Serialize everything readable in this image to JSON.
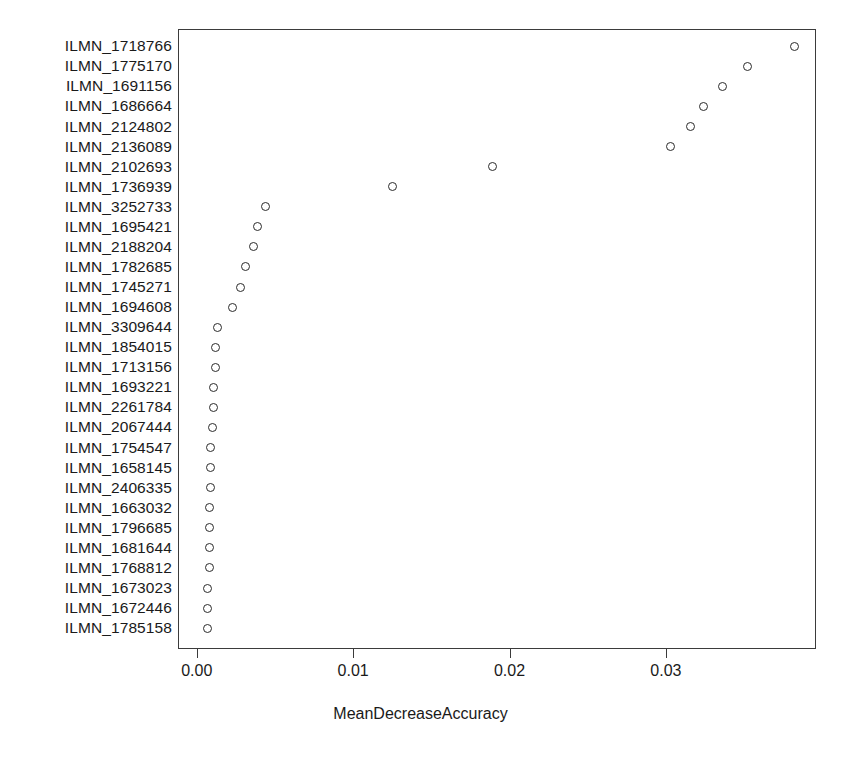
{
  "chart_data": {
    "type": "scatter",
    "title": "",
    "xlabel": "MeanDecreaseAccuracy",
    "ylabel": "",
    "xlim": [
      -0.0012,
      0.0396
    ],
    "xticks": [
      0.0,
      0.01,
      0.02,
      0.03
    ],
    "xtick_labels": [
      "0.00",
      "0.01",
      "0.02",
      "0.03"
    ],
    "grid": false,
    "legend": null,
    "orientation": "horizontal-dotchart",
    "marker": "open-circle",
    "categories": [
      "ILMN_1718766",
      "ILMN_1775170",
      "ILMN_1691156",
      "ILMN_1686664",
      "ILMN_2124802",
      "ILMN_2136089",
      "ILMN_2102693",
      "ILMN_1736939",
      "ILMN_3252733",
      "ILMN_1695421",
      "ILMN_2188204",
      "ILMN_1782685",
      "ILMN_1745271",
      "ILMN_1694608",
      "ILMN_3309644",
      "ILMN_1854015",
      "ILMN_1713156",
      "ILMN_1693221",
      "ILMN_2261784",
      "ILMN_2067444",
      "ILMN_1754547",
      "ILMN_1658145",
      "ILMN_2406335",
      "ILMN_1663032",
      "ILMN_1796685",
      "ILMN_1681644",
      "ILMN_1768812",
      "ILMN_1673023",
      "ILMN_1672446",
      "ILMN_1785158"
    ],
    "values": [
      0.0382,
      0.0352,
      0.0336,
      0.0324,
      0.0316,
      0.0303,
      0.0189,
      0.0125,
      0.0044,
      0.0039,
      0.0036,
      0.0031,
      0.0028,
      0.0023,
      0.0013,
      0.0012,
      0.0012,
      0.0011,
      0.0011,
      0.001,
      0.0009,
      0.0009,
      0.0009,
      0.0008,
      0.0008,
      0.0008,
      0.0008,
      0.0007,
      0.0007,
      0.0007
    ]
  }
}
